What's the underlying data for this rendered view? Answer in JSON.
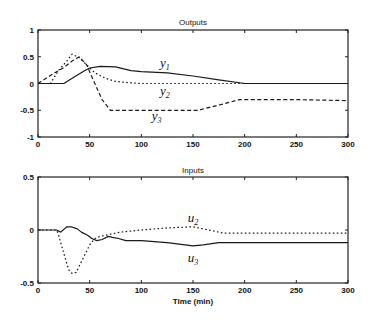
{
  "chart_data": [
    {
      "type": "line",
      "title": "Outputs",
      "xlabel": "",
      "ylabel": "",
      "xlim": [
        0,
        300
      ],
      "ylim": [
        -1,
        1
      ],
      "xticks": [
        0,
        50,
        100,
        150,
        200,
        250,
        300
      ],
      "yticks": [
        1,
        0.5,
        0,
        -0.5,
        -1
      ],
      "ytick_labels": [
        "1",
        "0.5",
        "0",
        "-0.5",
        "-1"
      ],
      "grid": false,
      "series": [
        {
          "name": "y1",
          "base": "y",
          "sub": "1",
          "style": "solid",
          "x": [
            0,
            25,
            35,
            45,
            50,
            60,
            75,
            90,
            100,
            125,
            150,
            175,
            200,
            250,
            300
          ],
          "y": [
            0,
            0,
            0.12,
            0.24,
            0.29,
            0.32,
            0.31,
            0.24,
            0.22,
            0.2,
            0.14,
            0.07,
            0.0,
            0.0,
            0.0
          ],
          "label_at": [
            118,
            0.3
          ]
        },
        {
          "name": "y2",
          "base": "y",
          "sub": "2",
          "style": "dotted",
          "x": [
            0,
            12,
            20,
            28,
            33,
            40,
            48,
            55,
            65,
            75,
            85,
            100,
            150,
            200,
            250,
            300
          ],
          "y": [
            0,
            0.0,
            0.25,
            0.42,
            0.55,
            0.48,
            0.33,
            0.2,
            0.1,
            0.04,
            0.02,
            0.0,
            0.0,
            0.0,
            0.0,
            0.0
          ],
          "label_at": [
            118,
            -0.22
          ]
        },
        {
          "name": "y3",
          "base": "y",
          "sub": "3",
          "style": "dashed",
          "x": [
            0,
            12,
            25,
            33,
            40,
            47,
            55,
            62,
            70,
            100,
            155,
            165,
            180,
            195,
            250,
            300
          ],
          "y": [
            0,
            0.15,
            0.3,
            0.42,
            0.5,
            0.35,
            0.0,
            -0.3,
            -0.5,
            -0.5,
            -0.5,
            -0.45,
            -0.38,
            -0.3,
            -0.3,
            -0.32
          ],
          "label_at": [
            110,
            -0.68
          ]
        }
      ]
    },
    {
      "type": "line",
      "title": "Inputs",
      "xlabel": "Time (min)",
      "ylabel": "",
      "xlim": [
        0,
        300
      ],
      "ylim": [
        -0.5,
        0.5
      ],
      "xticks": [
        0,
        50,
        100,
        150,
        200,
        250,
        300
      ],
      "yticks": [
        0.5,
        0,
        -0.5
      ],
      "ytick_labels": [
        "0.5",
        "0",
        "-0.5"
      ],
      "grid": false,
      "series": [
        {
          "name": "u2",
          "base": "u",
          "sub": "2",
          "style": "dotted",
          "x": [
            0,
            18,
            20,
            22,
            25,
            28,
            30,
            33,
            37,
            40,
            43,
            47,
            50,
            55,
            60,
            65,
            70,
            80,
            100,
            125,
            150,
            165,
            180,
            200,
            250,
            300
          ],
          "y": [
            0,
            0,
            -0.05,
            -0.12,
            -0.22,
            -0.32,
            -0.38,
            -0.41,
            -0.4,
            -0.34,
            -0.28,
            -0.2,
            -0.14,
            -0.08,
            -0.06,
            -0.05,
            -0.04,
            -0.02,
            0.0,
            0.02,
            0.03,
            0.0,
            -0.03,
            -0.03,
            -0.03,
            -0.03
          ],
          "label_at": [
            145,
            0.08
          ]
        },
        {
          "name": "u3",
          "base": "u",
          "sub": "3",
          "style": "solid",
          "x": [
            0,
            18,
            22,
            28,
            32,
            38,
            42,
            48,
            52,
            57,
            62,
            68,
            72,
            78,
            85,
            100,
            125,
            150,
            160,
            175,
            200,
            250,
            300
          ],
          "y": [
            0,
            0,
            -0.02,
            0.03,
            0.03,
            0.01,
            -0.02,
            -0.05,
            -0.08,
            -0.1,
            -0.09,
            -0.06,
            -0.07,
            -0.08,
            -0.1,
            -0.1,
            -0.12,
            -0.15,
            -0.14,
            -0.12,
            -0.12,
            -0.12,
            -0.12
          ],
          "label_at": [
            145,
            -0.3
          ]
        }
      ]
    }
  ]
}
